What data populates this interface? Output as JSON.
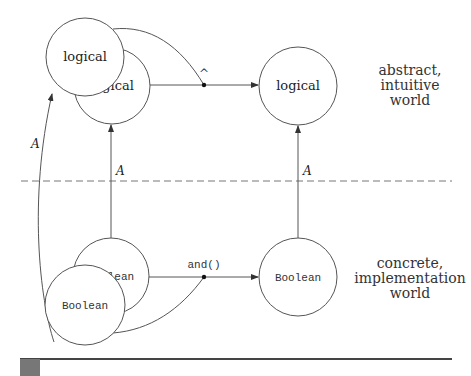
{
  "diagram": {
    "abstract_nodes": {
      "front_left": "logical",
      "back_left": "logical",
      "right": "logical"
    },
    "concrete_nodes": {
      "back_left": "Boolean",
      "front_left": "Boolean",
      "right": "Boolean"
    },
    "operators": {
      "abstract": "^",
      "concrete": "and()"
    },
    "mapping_labels": {
      "left_curve": "A",
      "middle": "A",
      "right": "A"
    },
    "worlds": {
      "abstract": {
        "line1": "abstract,",
        "line2": "intuitive",
        "line3": "world"
      },
      "concrete": {
        "line1": "concrete,",
        "line2": "implementation",
        "line3": "world"
      }
    }
  },
  "colors": {
    "stroke": "#555555",
    "text": "#222222",
    "divider": "#777777",
    "footer_rule": "#444444"
  }
}
